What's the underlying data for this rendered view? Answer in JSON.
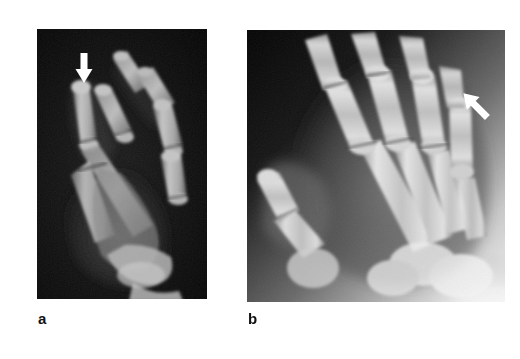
{
  "figure": {
    "background_color": "#ffffff",
    "panel_count": 2
  },
  "panels": [
    {
      "id": "a",
      "label": "a",
      "modality": "radiograph",
      "view": "oblique-lateral-hand",
      "description": "Oblique lateral radiograph of the hand with dark background showing overlapping metacarpals and phalanges",
      "background_color": "#0b0b0b",
      "bone_color": "#b9b9b9",
      "x": 37,
      "y": 29,
      "width": 170,
      "height": 270,
      "annotations": [
        {
          "type": "arrow",
          "name": "lesion-arrow",
          "color": "#ffffff",
          "direction": "down",
          "tail_x": 47,
          "tail_y": 26,
          "tip_x": 47,
          "tip_y": 52
        }
      ]
    },
    {
      "id": "b",
      "label": "b",
      "modality": "radiograph",
      "view": "posteroanterior-hand",
      "description": "Posteroanterior radiograph of the hand showing metacarpals, phalanges and thumb with bright overexposed carpal region at lower right",
      "background_color": "#070707",
      "bone_color": "#d8d8d8",
      "x": 247,
      "y": 30,
      "width": 258,
      "height": 272,
      "annotations": [
        {
          "type": "arrow",
          "name": "lesion-arrow",
          "color": "#ffffff",
          "direction": "down-left",
          "tail_x": 250,
          "tail_y": 75,
          "tip_x": 228,
          "tip_y": 96
        }
      ]
    }
  ],
  "labels": {
    "a": "a",
    "b": "b"
  }
}
